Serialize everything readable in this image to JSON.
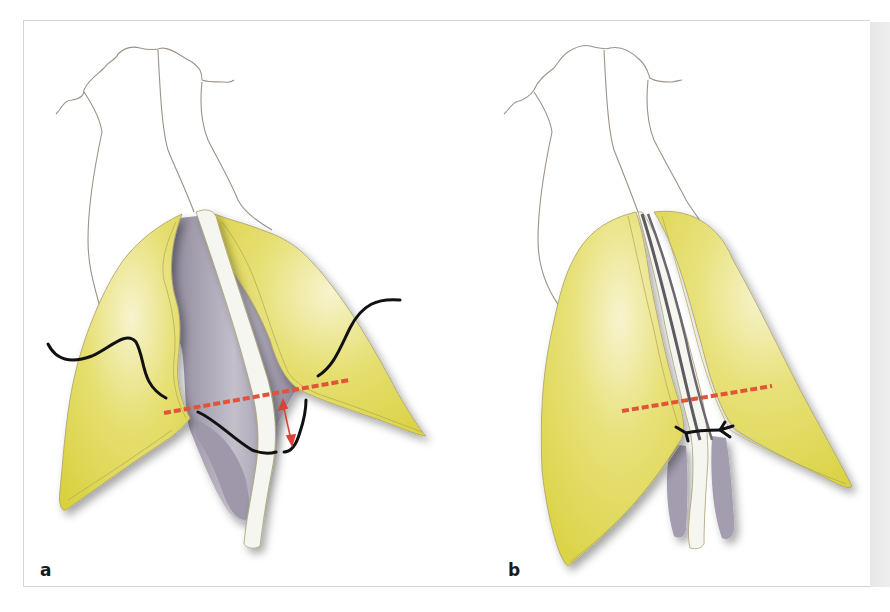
{
  "figure": {
    "panels": [
      {
        "id": "a",
        "label": "a",
        "description": "Lateral crura with transdomal suture passed through both crura; red dashed line marks level; red arrow shows vertical distance"
      },
      {
        "id": "b",
        "label": "b",
        "description": "Lateral crura approximated after suture is tied; red dashed line marks level; black knot at midline"
      }
    ],
    "colors": {
      "cartilage": "#dcd64a",
      "cartilage_highlight": "#f6f3c8",
      "mucosa": "#a9a3b4",
      "septum": "#f4f4ef",
      "outline": "#9b9388",
      "suture": "#111111",
      "marker_line": "#e0553a",
      "frame_border": "#d4d4d4",
      "side_strip": "#e8e8e8"
    }
  }
}
